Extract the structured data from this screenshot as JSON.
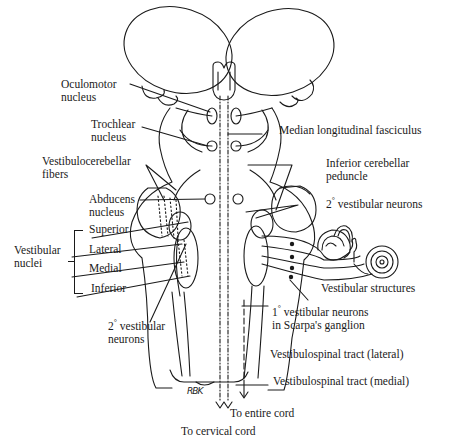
{
  "figure": {
    "type": "anatomical-diagram",
    "signature": "RBK"
  },
  "labels": {
    "oculomotor": {
      "line1": "Oculomotor",
      "line2": "nucleus"
    },
    "trochlear": {
      "line1": "Trochlear",
      "line2": "nucleus"
    },
    "vestibulocerebellar": {
      "line1": "Vestibulocerebellar",
      "line2": "fibers"
    },
    "abducens": {
      "line1": "Abducens",
      "line2": "nucleus"
    },
    "vestibular_nuclei_group": {
      "line1": "Vestibular",
      "line2": "nuclei"
    },
    "vestibular_nuclei": [
      "Superior",
      "Lateral",
      "Medial",
      "Inferior"
    ],
    "secondary_left": {
      "prefix": "2",
      "deg": "°",
      "line1": " vestibular",
      "line2": "neurons"
    },
    "mlf": "Median longitudinal fasciculus",
    "inferior_cerebellar": {
      "line1": "Inferior cerebellar",
      "line2": "peduncle"
    },
    "secondary_right": {
      "prefix": "2",
      "deg": "°",
      "text": " vestibular neurons"
    },
    "vestibular_structures": "Vestibular structures",
    "primary": {
      "prefix": "1",
      "deg": "°",
      "line1": " vestibular neurons",
      "line2": "in Scarpa's ganglion"
    },
    "vst_lateral": "Vestibulospinal tract (lateral)",
    "vst_medial": "Vestibulospinal tract (medial)",
    "to_entire_cord": "To entire cord",
    "to_cervical_cord": "To cervical cord"
  },
  "colors": {
    "line": "#1a1a1a",
    "background": "#ffffff"
  }
}
